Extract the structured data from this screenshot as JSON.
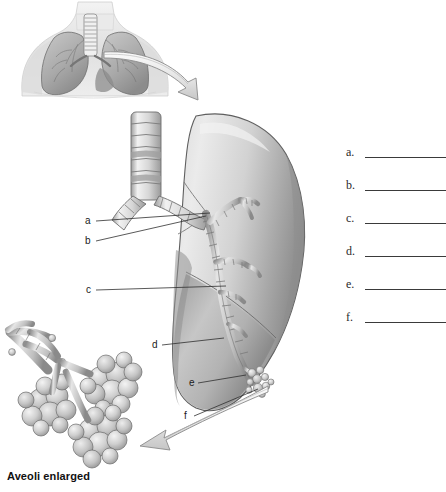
{
  "worksheet": {
    "title": "Respiratory System Labeling Worksheet",
    "caption": "Aveoli enlarged",
    "background_color": "#ffffff",
    "ink_color": "#1b1b1b"
  },
  "figure": {
    "torso_inset": {
      "name": "anterior thorax with lungs and trachea",
      "fill_light": "#e8e8e8",
      "fill_mid": "#bfbfbf",
      "fill_dark": "#8e8e8e"
    },
    "lung": {
      "name": "enlarged right lung with bronchial tree",
      "fill_light": "#e4e4e4",
      "fill_mid": "#c2c2c2",
      "fill_dark": "#8a8a8a",
      "outline": "#5b5b5b"
    },
    "alveoli": {
      "name": "enlarged alveolar sacs cluster",
      "fill_light": "#ececec",
      "fill_mid": "#c6c6c6",
      "fill_dark": "#9a9a9a"
    },
    "arrows": [
      {
        "name": "torso-to-lung-arrow",
        "direction": "down-right"
      },
      {
        "name": "lung-to-alveoli-arrow",
        "direction": "left"
      }
    ]
  },
  "leader_labels": [
    {
      "id": "a",
      "text": "a",
      "x": 85,
      "y": 217
    },
    {
      "id": "b",
      "text": "b",
      "x": 85,
      "y": 237
    },
    {
      "id": "c",
      "text": "c",
      "x": 86,
      "y": 286
    },
    {
      "id": "d",
      "text": "d",
      "x": 152,
      "y": 341
    },
    {
      "id": "e",
      "text": "e",
      "x": 190,
      "y": 379
    },
    {
      "id": "f",
      "text": "f",
      "x": 184,
      "y": 412
    }
  ],
  "answer_blanks": [
    {
      "letter": "a.",
      "value": ""
    },
    {
      "letter": "b.",
      "value": ""
    },
    {
      "letter": "c.",
      "value": ""
    },
    {
      "letter": "d.",
      "value": ""
    },
    {
      "letter": "e.",
      "value": ""
    },
    {
      "letter": "f.",
      "value": ""
    }
  ]
}
